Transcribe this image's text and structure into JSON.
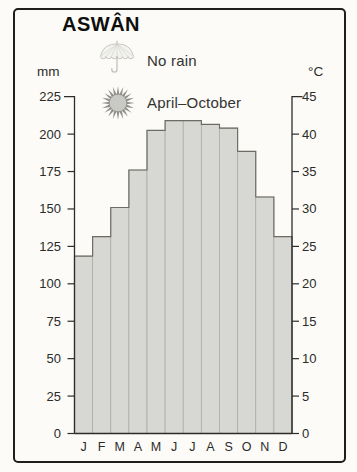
{
  "card": {
    "title": "ASWÂN"
  },
  "annotations": {
    "rain_label": "No rain",
    "sun_label": "April–October"
  },
  "axis_units": {
    "left": "mm",
    "right": "°C"
  },
  "icons": [
    "umbrella-icon",
    "sun-icon"
  ],
  "colors": {
    "bar_fill": "#d7d7d3",
    "bar_divider": "#adada8",
    "bar_outline": "#6c6c66",
    "axis": "#2d2d2a",
    "label": "#2b2b28",
    "border": "#1e1e1c",
    "icon_gray": "#90908b",
    "umbrella_gray": "#c7c7c1"
  },
  "chart_data": {
    "type": "bar",
    "title": "ASWÂN",
    "categories": [
      "J",
      "F",
      "M",
      "A",
      "M",
      "J",
      "J",
      "A",
      "S",
      "O",
      "N",
      "D"
    ],
    "series": [
      {
        "name": "Temperature (°C)",
        "values": [
          23.7,
          26.3,
          30.2,
          35.2,
          40.5,
          41.8,
          41.8,
          41.3,
          40.8,
          37.7,
          31.6,
          26.3
        ]
      }
    ],
    "rainfall_note": "No rain",
    "hot_season_note": "April–October",
    "left_axis": {
      "unit": "mm",
      "min": 0,
      "max": 225,
      "step": 25,
      "ticks": [
        0,
        25,
        50,
        75,
        100,
        125,
        150,
        175,
        200,
        225
      ]
    },
    "right_axis": {
      "unit": "°C",
      "min": 0,
      "max": 45,
      "step": 5,
      "ticks": [
        0,
        5,
        10,
        15,
        20,
        25,
        30,
        35,
        40,
        45
      ]
    },
    "grid": false,
    "legend_position": "none",
    "bars_contiguous": true
  }
}
